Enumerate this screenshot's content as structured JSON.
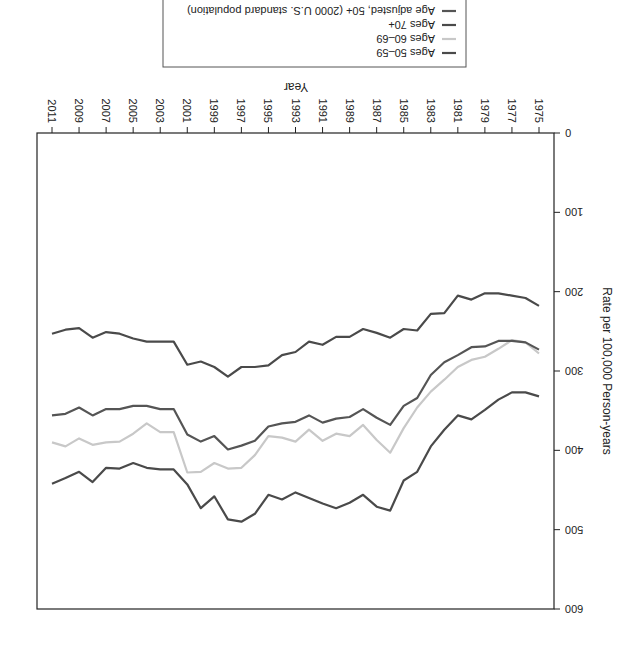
{
  "chart_data": {
    "type": "line",
    "orientation_note": "image rendered rotated 180 degrees",
    "title": "",
    "xlabel": "Year",
    "ylabel": "Rate per 100,000 Person-years",
    "xlim": [
      1975,
      2011
    ],
    "ylim": [
      0,
      600
    ],
    "x_ticks": [
      1975,
      1977,
      1979,
      1981,
      1983,
      1985,
      1987,
      1989,
      1991,
      1993,
      1995,
      1997,
      1999,
      2001,
      2003,
      2005,
      2007,
      2009,
      2011
    ],
    "y_ticks": [
      0,
      100,
      200,
      300,
      400,
      500,
      600
    ],
    "grid": false,
    "legend_position": "bottom-inside-box",
    "x": [
      1975,
      1976,
      1977,
      1978,
      1979,
      1980,
      1981,
      1982,
      1983,
      1984,
      1985,
      1986,
      1987,
      1988,
      1989,
      1990,
      1991,
      1992,
      1993,
      1994,
      1995,
      1996,
      1997,
      1998,
      1999,
      2000,
      2001,
      2002,
      2003,
      2004,
      2005,
      2006,
      2007,
      2008,
      2009,
      2010,
      2011
    ],
    "series": [
      {
        "name": "Ages 50–59",
        "color": "#4a4a4a",
        "values": [
          218,
          208,
          205,
          202,
          202,
          210,
          205,
          227,
          228,
          249,
          247,
          258,
          252,
          247,
          257,
          257,
          267,
          263,
          276,
          280,
          293,
          295,
          295,
          307,
          295,
          288,
          292,
          263,
          263,
          263,
          259,
          253,
          251,
          258,
          246,
          248,
          253
        ]
      },
      {
        "name": "Ages 60–69",
        "color": "#c8c8c8",
        "values": [
          278,
          264,
          261,
          272,
          282,
          286,
          295,
          311,
          326,
          346,
          372,
          403,
          387,
          368,
          382,
          379,
          388,
          374,
          389,
          384,
          382,
          406,
          422,
          423,
          416,
          427,
          428,
          377,
          377,
          366,
          379,
          389,
          390,
          393,
          385,
          395,
          390
        ]
      },
      {
        "name": "Ages 70+",
        "color": "#4a4a4a",
        "values": [
          332,
          327,
          327,
          336,
          349,
          361,
          356,
          374,
          395,
          427,
          438,
          476,
          471,
          456,
          466,
          473,
          467,
          460,
          453,
          462,
          456,
          480,
          490,
          487,
          458,
          473,
          443,
          424,
          424,
          422,
          416,
          423,
          422,
          440,
          427,
          435,
          442
        ]
      },
      {
        "name": "Age adjusted, 50+ (2000 U.S. standard population)",
        "color": "#555555",
        "values": [
          273,
          264,
          262,
          262,
          269,
          270,
          280,
          289,
          305,
          334,
          344,
          368,
          359,
          348,
          358,
          360,
          365,
          356,
          364,
          366,
          370,
          388,
          394,
          399,
          382,
          389,
          380,
          348,
          348,
          344,
          344,
          348,
          348,
          356,
          346,
          354,
          356
        ]
      }
    ]
  },
  "axes": {
    "x_title": "Year",
    "y_title": "Rate per 100,000 Person-years"
  },
  "legend": {
    "items": [
      "Ages 50–59",
      "Ages 60–69",
      "Ages 70+",
      "Age adjusted, 50+ (2000 U.S. standard population)"
    ]
  }
}
